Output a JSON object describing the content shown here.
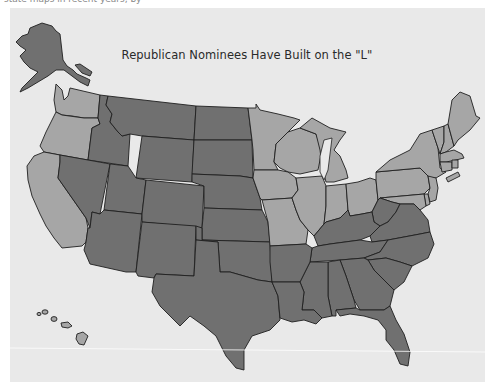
{
  "caption_fragment": "state maps in recent years, by",
  "map": {
    "title": "Republican Nominees Have Built on the \"L\"",
    "background": "#e9e9e9",
    "legend_colors": {
      "republican": "#707070",
      "democratic": "#a6a6a6",
      "border": "#1f1f1f"
    },
    "states": {
      "republican": [
        "AK",
        "ID",
        "MT",
        "WY",
        "ND",
        "SD",
        "NE",
        "KS",
        "OK",
        "TX",
        "NV",
        "UT",
        "CO",
        "AZ",
        "NM",
        "AR",
        "LA",
        "MS",
        "AL",
        "GA",
        "FL",
        "SC",
        "NC",
        "TN",
        "KY",
        "VA",
        "WV"
      ],
      "democratic": [
        "WA",
        "OR",
        "CA",
        "HI",
        "MN",
        "WI",
        "IA",
        "MO",
        "IL",
        "MI",
        "IN",
        "OH",
        "PA",
        "NY",
        "VT",
        "NH",
        "ME",
        "MA",
        "RI",
        "CT",
        "NJ",
        "DE",
        "MD"
      ]
    }
  }
}
